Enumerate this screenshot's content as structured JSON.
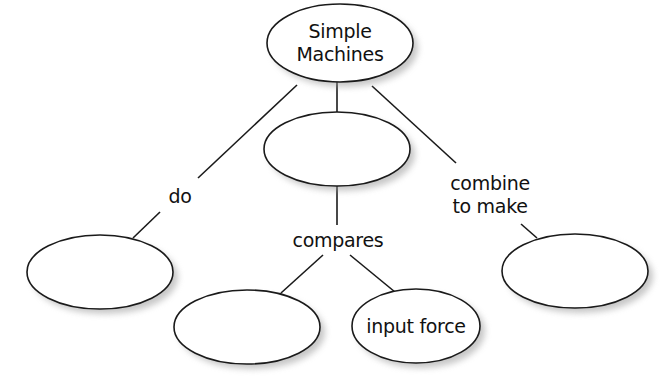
{
  "diagram": {
    "type": "concept-map",
    "nodes": [
      {
        "id": "root",
        "label_lines": [
          "Simple",
          "Machines"
        ],
        "cx": 340,
        "cy": 43,
        "rx": 73,
        "ry": 39
      },
      {
        "id": "middle",
        "label_lines": [],
        "cx": 337,
        "cy": 149,
        "rx": 73,
        "ry": 37
      },
      {
        "id": "left",
        "label_lines": [],
        "cx": 100,
        "cy": 272,
        "rx": 73,
        "ry": 37
      },
      {
        "id": "right",
        "label_lines": [],
        "cx": 575,
        "cy": 271,
        "rx": 73,
        "ry": 37
      },
      {
        "id": "bottom-left",
        "label_lines": [],
        "cx": 247,
        "cy": 327,
        "rx": 73,
        "ry": 37
      },
      {
        "id": "input-force",
        "label_lines": [
          "input force"
        ],
        "cx": 416,
        "cy": 326,
        "rx": 64,
        "ry": 37
      }
    ],
    "edges": [
      {
        "from": "root",
        "to": "left",
        "label": "do"
      },
      {
        "from": "root",
        "to": "middle",
        "label": ""
      },
      {
        "from": "root",
        "to": "right",
        "label": "combine to make"
      },
      {
        "from": "middle",
        "to": "bottom-left",
        "label": "compares"
      },
      {
        "from": "middle",
        "to": "input-force",
        "label": "compares"
      }
    ],
    "labels": {
      "root_line1": "Simple",
      "root_line2": "Machines",
      "input_force": "input force",
      "do": "do",
      "combine_line1": "combine",
      "combine_line2": "to make",
      "compares": "compares"
    }
  }
}
